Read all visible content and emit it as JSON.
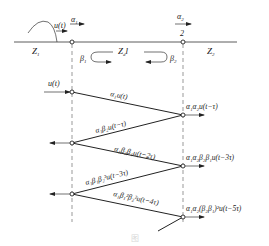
{
  "diagram": {
    "type": "traveling-wave reflection lattice diagram",
    "top_line": {
      "left_region_label": "Z",
      "left_region_sub": "1",
      "middle_label": "Z",
      "middle_sub": "d",
      "middle_suffix": "l",
      "right_region_label": "Z",
      "right_region_sub": "2",
      "node2_label": "2",
      "incident_wave_label": "u(t)",
      "alpha1_label": "α",
      "alpha1_sub": "1",
      "alpha2_label": "α",
      "alpha2_sub": "2",
      "beta1_label": "β",
      "beta1_sub": "1",
      "beta2_label": "β",
      "beta2_sub": "2"
    },
    "lattice": {
      "input_label": "u(t)",
      "segments": [
        {
          "label": "α₁u(t)"
        },
        {
          "label": "α₁β₂u(t−τ)"
        },
        {
          "label": "α₁β₂β₁u(t−2τ)"
        },
        {
          "label": "α₁β₁β₂²u(t−3τ)"
        },
        {
          "label": "α₁β₁²β₂²u(t−4τ)"
        }
      ],
      "transmitted": [
        {
          "label": "α₁α₂u(t−τ)"
        },
        {
          "label": "α₁α₂β₂β₁u(t−3τ)"
        },
        {
          "label": "α₁α₂(β₂β₁)²u(t−5τ)"
        }
      ]
    },
    "caption": "图"
  }
}
